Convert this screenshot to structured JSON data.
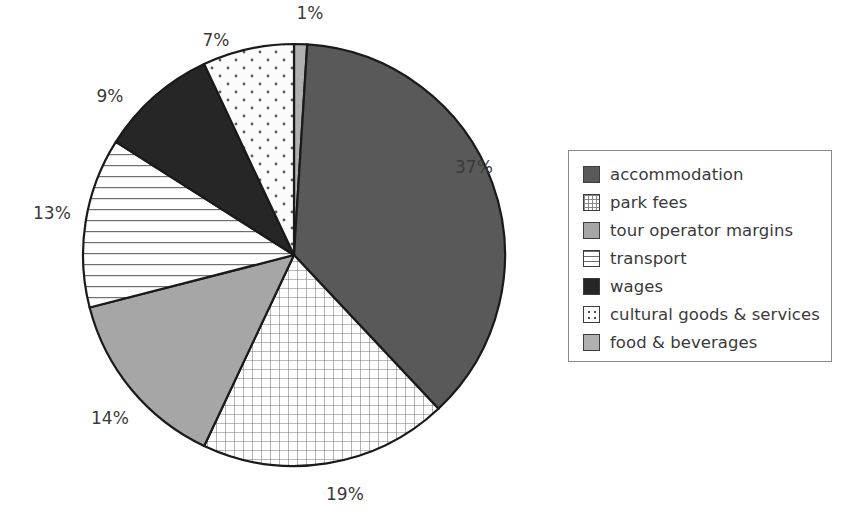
{
  "chart_data": {
    "type": "pie",
    "title": "",
    "subtitle": "",
    "xlabel": "",
    "ylabel": "",
    "legend_position": "right",
    "grid": false,
    "value_unit": "%",
    "start_angle_deg": 0,
    "direction": "clockwise",
    "categories": [
      "accommodation",
      "park fees",
      "tour operator margins",
      "transport",
      "wages",
      "cultural goods & services",
      "food & beverages"
    ],
    "values": [
      37,
      19,
      14,
      13,
      9,
      7,
      1
    ],
    "slices": [
      {
        "label": "accommodation",
        "value": 37,
        "display": "37%",
        "fill_style": "solid",
        "color": "#595959",
        "label_x": 474,
        "label_y": 167
      },
      {
        "label": "park fees",
        "value": 19,
        "display": "19%",
        "fill_style": "grid",
        "color": "#ffffff",
        "label_x": 345,
        "label_y": 494
      },
      {
        "label": "tour operator margins",
        "value": 14,
        "display": "14%",
        "fill_style": "solid",
        "color": "#a6a6a6",
        "label_x": 110,
        "label_y": 418
      },
      {
        "label": "transport",
        "value": 13,
        "display": "13%",
        "fill_style": "horizontal-lines",
        "color": "#ffffff",
        "label_x": 52,
        "label_y": 213
      },
      {
        "label": "wages",
        "value": 9,
        "display": "9%",
        "fill_style": "solid",
        "color": "#262626",
        "label_x": 110,
        "label_y": 96
      },
      {
        "label": "cultural goods & services",
        "value": 7,
        "display": "7%",
        "fill_style": "dots",
        "color": "#fbfbfb",
        "label_x": 216,
        "label_y": 40
      },
      {
        "label": "food & beverages",
        "value": 1,
        "display": "1%",
        "fill_style": "solid",
        "color": "#b0b0b0",
        "label_x": 310,
        "label_y": 13
      }
    ]
  },
  "legend": {
    "items": [
      {
        "label": "accommodation",
        "swatch": "solid-dark-gray"
      },
      {
        "label": "park fees",
        "swatch": "grid"
      },
      {
        "label": "tour operator margins",
        "swatch": "solid-medium-gray"
      },
      {
        "label": "transport",
        "swatch": "horizontal-lines"
      },
      {
        "label": "wages",
        "swatch": "solid-black"
      },
      {
        "label": "cultural goods & services",
        "swatch": "dots"
      },
      {
        "label": "food & beverages",
        "swatch": "solid-light-gray"
      }
    ]
  },
  "colors": {
    "accommodation": "#595959",
    "tour_operator_margins": "#a6a6a6",
    "wages": "#262626",
    "food_beverages": "#b0b0b0",
    "outline": "#1a1a1a",
    "text": "#3a3a3a",
    "legend_border": "#8a8a8a"
  }
}
